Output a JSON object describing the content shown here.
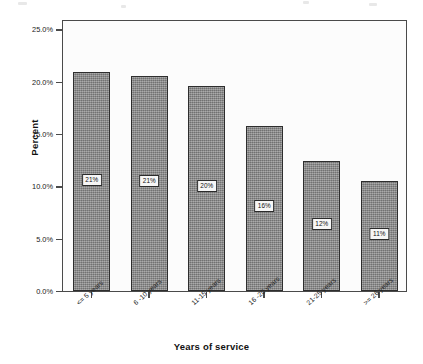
{
  "chart_data": {
    "type": "bar",
    "title": "",
    "xlabel": "Years of service",
    "ylabel": "Percent",
    "categories": [
      "<= 5 years",
      "6 -10 years",
      "11-15 years",
      "16 -20 years",
      "21-25 years",
      ">= 26 years"
    ],
    "values": [
      20.9,
      20.6,
      19.6,
      15.8,
      12.4,
      10.5
    ],
    "data_labels": [
      "21%",
      "21%",
      "20%",
      "16%",
      "12%",
      "11%"
    ],
    "ylim": [
      0,
      26
    ],
    "yticks": [
      0,
      5,
      10,
      15,
      20,
      25
    ],
    "ytick_labels": [
      "0.0%",
      "5.0%",
      "10.0%",
      "15.0%",
      "20.0%",
      "25.0%"
    ],
    "grid": false,
    "legend": false,
    "bar_color": "#8b8b8b",
    "bar_edge_color": "#2e2e2e",
    "axis_color": "#4a4a4a",
    "plot_background": "#fcfcfc"
  }
}
